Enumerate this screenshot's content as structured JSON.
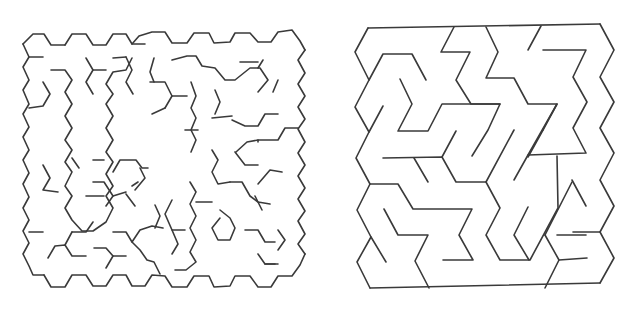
{
  "figure": {
    "background": "#ffffff",
    "stroke": "#3a3a3a",
    "panels": [
      {
        "id": "hex-cell-maze",
        "description": "Maze on a hexagonal cell grid (honeycomb walls)",
        "paths": [
          "M23,44 L33,34 L44,34 L51,45 L65,45",
          "M65,45 L72,34 L86,34 L93,45 L106,45 L113,34 L126,34 L132,44 L145,44",
          "M132,44 L139,36 L152,32 L165,32 L172,43 L187,43 L194,33 L209,33 L214,43 L230,42 L235,33 L250,33 L258,42 L271,42 L278,32 L292,30 L300,41 L305,50",
          "M23,44 L29,57 L23,67 L29,80 L23,90 L29,104 L23,114 L29,127 L23,137 L29,150 L23,160 L29,173 L23,184 L29,197 L23,208 L29,220 L23,231 L29,243 L23,254 L29,266 L33,275 L44,275",
          "M44,275 L51,287 L65,287 L72,275 L86,275 L93,286 L106,286 L113,275 L126,275 L132,286 L145,286 L152,275 L165,276 L172,287 L187,287 L194,276 L209,276 L214,287 L230,286 L235,276 L250,276 L258,287 L271,287 L278,276 L292,276 L300,265 L305,254",
          "M305,50 L298,60 L305,73 L298,84 L305,96 L298,107 L305,119 L298,129 L305,142 L298,153 L305,165 L298,176 L305,188 L298,199 L305,211 L298,221 L305,234 L298,244 L305,254",
          "M29,57 L43,57",
          "M51,70 L65,70 L72,80 L65,92 L72,104 L65,116 L72,128 L65,140 L72,150 L65,162 L72,172 L65,186 L72,196 L65,208 L72,220 L82,231 L93,231 L106,222 L113,208 L106,196 L113,186 L106,174 L113,162 L106,152 L113,140 L106,128 L113,116 L106,104 L113,94 L106,84 L113,72 L126,70 L132,58",
          "M43,82 L50,94 L43,106 L29,108",
          "M86,58 L93,70 L86,82 L93,94",
          "M93,70 L106,70",
          "M113,58 L126,57",
          "M126,57 L132,70 L126,82 L133,94",
          "M154,58 L150,72 L154,82",
          "M150,82 L165,82 L172,96 L165,108",
          "M172,96 L187,96",
          "M165,108 L152,114",
          "M172,60 L187,56 L196,56 L202,66 L215,68 L225,80 L235,80 L250,68 L260,68 L268,80 L258,92",
          "M240,62 L258,62",
          "M258,68 L263,60",
          "M273,92 L278,80",
          "M298,128 L285,128 L278,140 L258,140 L258,142",
          "M191,82 L196,96 L191,108 L196,118 L191,130 L196,140 L191,152",
          "M215,90 L220,102 L215,114",
          "M212,118 L222,117 L232,116",
          "M185,130 L198,130",
          "M190,182 L196,192 L190,204 L196,216 L190,228 L196,240 L190,252 L196,262 L186,270 L175,270",
          "M196,202 L212,202",
          "M172,200 L165,214 L172,230 L185,230",
          "M172,230 L178,244 L172,254",
          "M212,150 L218,160 L212,172 L218,184 L230,182",
          "M230,182 L242,182 L250,196 L258,202 L270,204",
          "M258,184 L270,170 L282,172",
          "M235,152 L245,165 L258,165",
          "M255,196 L262,210",
          "M220,210 L230,218 L235,228 L230,240 L218,240 L212,228 L220,218",
          "M245,230 L258,230 L265,242 L275,242",
          "M278,230 L285,240 L278,250",
          "M258,254 L265,264 L278,264",
          "M265,264 L275,264",
          "M232,120 L245,126 L258,126 L265,114 L278,114",
          "M236,152 L247,142 L258,140",
          "M43,165 L50,178 L43,190 L58,192",
          "M72,158 L79,168",
          "M29,232 L43,232",
          "M48,258 L55,246 L65,245 L72,256 L86,256",
          "M65,245 L72,232",
          "M72,232 L86,232 L93,222",
          "M94,248 L106,248 L113,256 L106,268",
          "M113,256 L126,256",
          "M113,232 L126,232 L132,242 L140,250 L147,260 L154,262 L160,274",
          "M132,242 L140,230 L152,226 L163,228",
          "M155,205 L160,216 L155,228",
          "M93,182 L104,182 L113,196 L106,206",
          "M93,160 L104,160",
          "M113,172 L120,160 L136,160 L142,168 L148,168",
          "M113,196 L126,192",
          "M132,186 L138,182",
          "M140,168 L145,178 L135,190",
          "M126,194 L135,206",
          "M86,196 L104,196"
        ]
      },
      {
        "id": "hex-triangle-maze",
        "description": "Maze on a hexagon/triangle lattice with zigzag sides",
        "paths": [
          "M368,28 L600,24",
          "M600,24 L614,50 L600,77 L614,102 L600,128 L614,153 L600,180 L614,206 L600,232 L614,258 L600,283",
          "M370,288 L600,283",
          "M368,28 L355,52 L369,80 L355,107 L369,132 L356,158 L370,184 L357,210 L371,237 L357,262 L370,288",
          "M369,80 L383,54 L412,54 L426,80",
          "M454,27 L441,52 L470,52 L456,80 L471,104 L500,104 L488,130 L472,156",
          "M486,27 L498,52 L486,78 L514,78 L528,104 L557,104 L543,130",
          "M541,26 L528,50",
          "M543,130 L528,157",
          "M543,50 L586,50 L573,77 L587,102 L573,128 L586,153 L528,155 L514,180",
          "M557,104 L528,155",
          "M400,79 L412,104 L398,131 L428,131 L442,104 L500,104",
          "M369,132 L383,106",
          "M383,158 L442,157 L456,182 L486,182 L514,130",
          "M456,131 L442,157",
          "M414,158 L428,182",
          "M370,184 L398,184 L413,209 L472,209 L459,235 L473,260 L443,260",
          "M384,209 L398,235 L428,235 L415,261 L429,288",
          "M371,237 L386,262",
          "M486,182 L500,208 L486,235 L500,260 L530,260 L558,208 L557,156",
          "M545,235 L559,260 L545,288",
          "M557,235 L586,235",
          "M559,260 L587,258",
          "M572,180 L586,206",
          "M545,235 L572,182",
          "M600,232 L573,232",
          "M528,207 L514,235 L529,260"
        ]
      }
    ]
  }
}
